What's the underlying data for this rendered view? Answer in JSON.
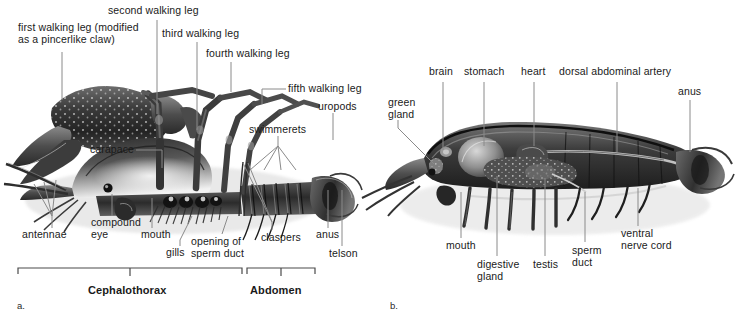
{
  "figure": {
    "background_color": "#ffffff",
    "text_color": "#1a1a1a",
    "leader_line_color": "#8a8a8a"
  },
  "panel_a": {
    "id": "a.",
    "caption": "external anatomy, lateral view",
    "labels": [
      {
        "key": "first_walking_leg",
        "text": "first walking leg (modified\nas a pincerlike claw)",
        "x": 18,
        "y": 28
      },
      {
        "key": "second_walking_leg",
        "text": "second walking leg",
        "x": 108,
        "y": 7
      },
      {
        "key": "third_walking_leg",
        "text": "third walking leg",
        "x": 162,
        "y": 30
      },
      {
        "key": "fourth_walking_leg",
        "text": "fourth walking leg",
        "x": 206,
        "y": 50
      },
      {
        "key": "fifth_walking_leg",
        "text": "fifth walking leg",
        "x": 288,
        "y": 84
      },
      {
        "key": "uropods",
        "text": "uropods",
        "x": 320,
        "y": 103
      },
      {
        "key": "swimmerets",
        "text": "swimmerets",
        "x": 250,
        "y": 126
      },
      {
        "key": "carapace",
        "text": "carapace",
        "x": 93,
        "y": 145
      },
      {
        "key": "antennae",
        "text": "antennae",
        "x": 22,
        "y": 231
      },
      {
        "key": "compound_eye",
        "text": "compound\neye",
        "x": 93,
        "y": 220
      },
      {
        "key": "mouth",
        "text": "mouth",
        "x": 143,
        "y": 232
      },
      {
        "key": "gills",
        "text": "gills",
        "x": 167,
        "y": 249
      },
      {
        "key": "opening_of_sperm_duct",
        "text": "opening of\nsperm duct",
        "x": 192,
        "y": 238
      },
      {
        "key": "claspers",
        "text": "claspers",
        "x": 262,
        "y": 234
      },
      {
        "key": "anus",
        "text": "anus",
        "x": 318,
        "y": 231
      },
      {
        "key": "telson",
        "text": "telson",
        "x": 330,
        "y": 250
      }
    ],
    "brackets": [
      {
        "key": "cephalothorax",
        "label": "Cephalothorax",
        "x1": 18,
        "x2": 242,
        "y": 268,
        "label_x": 90,
        "label_y": 288
      },
      {
        "key": "abdomen",
        "label": "Abdomen",
        "x1": 247,
        "x2": 315,
        "y": 268,
        "label_x": 252,
        "label_y": 288
      }
    ]
  },
  "panel_b": {
    "id": "b.",
    "caption": "internal anatomy, sagittal section",
    "labels": [
      {
        "key": "green_gland",
        "text": "green\ngland",
        "x": 389,
        "y": 100
      },
      {
        "key": "brain",
        "text": "brain",
        "x": 430,
        "y": 68
      },
      {
        "key": "stomach",
        "text": "stomach",
        "x": 465,
        "y": 68
      },
      {
        "key": "heart",
        "text": "heart",
        "x": 522,
        "y": 68
      },
      {
        "key": "dorsal_abdominal_artery",
        "text": "dorsal abdominal artery",
        "x": 560,
        "y": 68
      },
      {
        "key": "anus",
        "text": "anus",
        "x": 679,
        "y": 88
      },
      {
        "key": "mouth",
        "text": "mouth",
        "x": 448,
        "y": 243
      },
      {
        "key": "digestive_gland",
        "text": "digestive\ngland",
        "x": 478,
        "y": 262
      },
      {
        "key": "testis",
        "text": "testis",
        "x": 534,
        "y": 262
      },
      {
        "key": "sperm_duct",
        "text": "sperm\nduct",
        "x": 573,
        "y": 248
      },
      {
        "key": "ventral_nerve_cord",
        "text": "ventral\nnerve cord",
        "x": 622,
        "y": 231
      }
    ]
  }
}
